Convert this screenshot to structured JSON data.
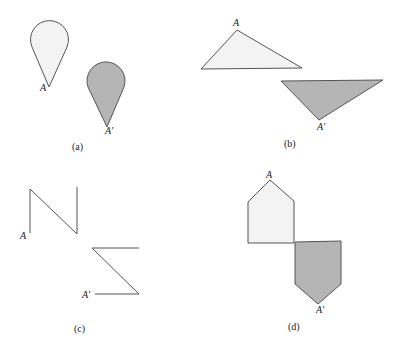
{
  "figure": {
    "panels": [
      {
        "id": "a",
        "caption": "(a)",
        "shape": "teardrop",
        "original_label": "A",
        "image_label": "A′"
      },
      {
        "id": "b",
        "caption": "(b)",
        "shape": "triangle",
        "original_label": "A",
        "image_label": "A′"
      },
      {
        "id": "c",
        "caption": "(c)",
        "shape": "N-polyline",
        "original_label": "A",
        "image_label": "A′"
      },
      {
        "id": "d",
        "caption": "(d)",
        "shape": "pentagon",
        "original_label": "A",
        "image_label": "A′"
      }
    ],
    "colors": {
      "original_fill": "#f3f3f3",
      "image_fill": "#b5b5b5",
      "stroke": "#555555"
    }
  }
}
